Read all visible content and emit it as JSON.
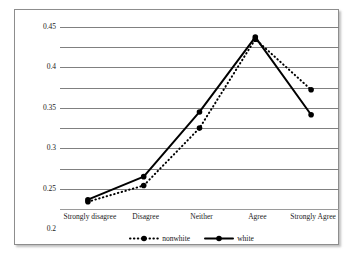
{
  "chart_data": {
    "type": "line",
    "title": "",
    "xlabel": "",
    "ylabel": "",
    "categories": [
      "Strongly disagree",
      "Disagree",
      "Neither",
      "Agree",
      "Strongly Agree"
    ],
    "ylim": [
      0,
      0.45
    ],
    "yticks": [
      "0",
      "0.05",
      "0.1",
      "0.15",
      "0.2",
      "0.25",
      "0.3",
      "0.35",
      "0.4",
      "0.45"
    ],
    "ytick_values": [
      0,
      0.05,
      0.1,
      0.15,
      0.2,
      0.25,
      0.3,
      0.35,
      0.4,
      0.45
    ],
    "grid": "horizontal",
    "legend_position": "bottom-center",
    "series": [
      {
        "name": "nonwhite",
        "values": [
          0.018,
          0.058,
          0.2,
          0.42,
          0.295
        ],
        "line_style": "dotted",
        "marker": "circle",
        "color": "#000000"
      },
      {
        "name": "white",
        "values": [
          0.023,
          0.08,
          0.24,
          0.425,
          0.233
        ],
        "line_style": "solid",
        "marker": "circle",
        "color": "#000000"
      }
    ]
  },
  "colors": {
    "gridline": "#808080",
    "frame": "#8d8d8d",
    "text": "#1a1a1a",
    "background": "#ffffff"
  }
}
